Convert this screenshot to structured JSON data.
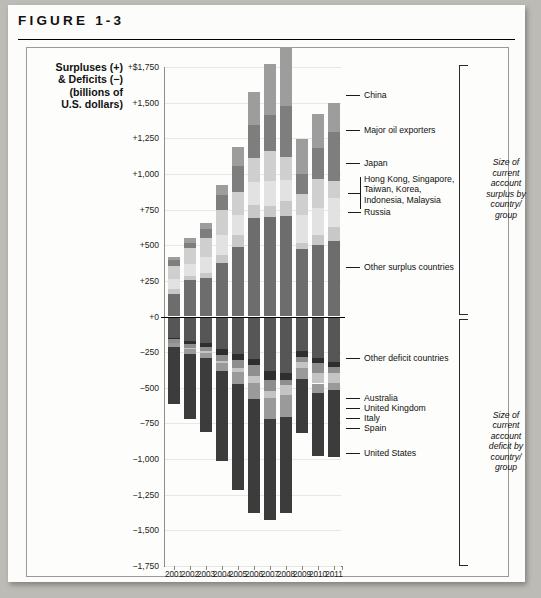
{
  "figure": {
    "label": "FIGURE 1-3"
  },
  "axis_title_lines": [
    "Surpluses (+)",
    "& Deficits (−)",
    "(billions of",
    "U.S. dollars)"
  ],
  "brackets": {
    "surplus": [
      "Size of",
      "current",
      "account",
      "surplus by",
      "country/",
      "group"
    ],
    "deficit": [
      "Size of",
      "current",
      "account",
      "deficit by",
      "country/",
      "group"
    ]
  },
  "callouts": {
    "china": "China",
    "oil": "Major oil exporters",
    "japan": "Japan",
    "asia_l1": "Hong Kong, Singapore,",
    "asia_l2": "Taiwan, Korea,",
    "asia_l3": "Indonesia, Malaysia",
    "russia": "Russia",
    "other_surplus": "Other surplus countries",
    "other_deficit": "Other deficit countries",
    "australia": "Australia",
    "uk": "United Kingdom",
    "italy": "Italy",
    "spain": "Spain",
    "usa": "United States"
  },
  "colors": {
    "other_surplus": "#6d6d6d",
    "russia": "#c8c8c8",
    "asia": "#e2e2e2",
    "japan": "#cfcfcf",
    "oil": "#7e7e7e",
    "china": "#9d9d9d",
    "other_deficit": "#565656",
    "australia": "#2e2e2e",
    "uk": "#8e8e8e",
    "italy": "#c4c4c4",
    "spain": "#9a9a9a",
    "usa": "#3c3c3c",
    "zero_line": "#000000",
    "grid": "#e7e7e4"
  },
  "chart_data": {
    "type": "bar",
    "title": "FIGURE 1-3",
    "subtype": "stacked-diverging",
    "xlabel": "",
    "ylabel": "Surpluses (+) & Deficits (−) (billions of U.S. dollars)",
    "ylim": [
      -1750,
      1750
    ],
    "ytick_labels": [
      "+$1,750",
      "+1,500",
      "+1,250",
      "+1,000",
      "+750",
      "+500",
      "+250",
      "+0",
      "−250",
      "−500",
      "−750",
      "−1,000",
      "−1,250",
      "−1,500",
      "−1,750"
    ],
    "ytick_values": [
      1750,
      1500,
      1250,
      1000,
      750,
      500,
      250,
      0,
      -250,
      -500,
      -750,
      -1000,
      -1250,
      -1500,
      -1750
    ],
    "grid": true,
    "legend_position": "right-callouts",
    "categories": [
      "2001",
      "2002",
      "2003",
      "2004",
      "2005",
      "2006",
      "2007",
      "2008",
      "2009",
      "2010",
      "2011"
    ],
    "series": [
      {
        "name": "Other surplus countries",
        "color": "#6d6d6d",
        "values": [
          160,
          255,
          270,
          375,
          490,
          690,
          700,
          705,
          470,
          500,
          530
        ]
      },
      {
        "name": "Russia",
        "color": "#c8c8c8",
        "values": [
          33,
          29,
          35,
          59,
          84,
          94,
          77,
          104,
          49,
          70,
          99
        ]
      },
      {
        "name": "Hong Kong, Singapore, Taiwan, Korea, Indonesia, Malaysia",
        "color": "#e2e2e2",
        "values": [
          72,
          85,
          110,
          140,
          135,
          160,
          175,
          150,
          195,
          190,
          200
        ]
      },
      {
        "name": "Japan",
        "color": "#cfcfcf",
        "values": [
          88,
          112,
          136,
          172,
          166,
          171,
          212,
          159,
          146,
          204,
          119
        ]
      },
      {
        "name": "Major oil exporters",
        "color": "#7e7e7e",
        "values": [
          45,
          35,
          60,
          105,
          180,
          230,
          250,
          360,
          140,
          215,
          345
        ]
      },
      {
        "name": "China",
        "color": "#9d9d9d",
        "values": [
          17,
          35,
          46,
          69,
          134,
          232,
          354,
          412,
          243,
          238,
          202
        ]
      }
    ],
    "deficit_series": [
      {
        "name": "Other deficit countries",
        "color": "#565656",
        "values": [
          -150,
          -175,
          -185,
          -230,
          -265,
          -300,
          -385,
          -395,
          -240,
          -290,
          -320
        ]
      },
      {
        "name": "Australia",
        "color": "#2e2e2e",
        "values": [
          -8,
          -16,
          -28,
          -39,
          -41,
          -41,
          -58,
          -47,
          -44,
          -33,
          -33
        ]
      },
      {
        "name": "United Kingdom",
        "color": "#8e8e8e",
        "values": [
          -30,
          -28,
          -26,
          -40,
          -53,
          -76,
          -79,
          -41,
          -33,
          -75,
          -46
        ]
      },
      {
        "name": "Italy",
        "color": "#c4c4c4",
        "values": [
          -1,
          -10,
          -20,
          -17,
          -30,
          -48,
          -52,
          -67,
          -43,
          -72,
          -68
        ]
      },
      {
        "name": "Spain",
        "color": "#9a9a9a",
        "values": [
          -24,
          -32,
          -31,
          -55,
          -83,
          -111,
          -145,
          -154,
          -75,
          -64,
          -51
        ]
      },
      {
        "name": "United States",
        "color": "#3c3c3c",
        "values": [
          -398,
          -459,
          -521,
          -634,
          -745,
          -800,
          -711,
          -677,
          -382,
          -442,
          -466
        ]
      }
    ]
  }
}
